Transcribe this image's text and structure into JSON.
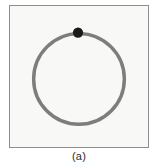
{
  "figure": {
    "caption": "(a)",
    "panel": {
      "background_color": "#f8f8f6",
      "border_color": "#8d8d8d",
      "x": 9,
      "y": 5,
      "width": 140,
      "height": 143
    },
    "shapes": {
      "ring": {
        "name": "circular-loop",
        "center_x": 70,
        "center_y": 74,
        "radius": 46,
        "stroke_color": "#7d7d7d",
        "stroke_width": 3.5,
        "fill": "none"
      },
      "marker": {
        "name": "bead-marker",
        "center_x": 69,
        "center_y": 27,
        "radius": 5.2,
        "fill_color": "#1a1a1a",
        "position_on_ring": "top"
      }
    }
  },
  "chart_data": {
    "type": "scatter",
    "title": "(a)",
    "xlabel": "",
    "ylabel": "",
    "xlim": [
      -1.25,
      1.25
    ],
    "ylim": [
      -1.25,
      1.25
    ],
    "grid": false,
    "legend": null,
    "series": [
      {
        "name": "circular loop",
        "kind": "circle-path",
        "center": [
          0,
          0
        ],
        "radius": 1.0,
        "color": "#7d7d7d",
        "linewidth": 3.5
      },
      {
        "name": "bead on loop",
        "kind": "point",
        "x": [
          0.0
        ],
        "y": [
          1.0
        ],
        "color": "#1a1a1a",
        "marker": "o",
        "markersize": 10
      }
    ],
    "annotations": [
      {
        "text": "(a)",
        "position": "below-axes",
        "color": "#2b2b2b"
      }
    ]
  }
}
